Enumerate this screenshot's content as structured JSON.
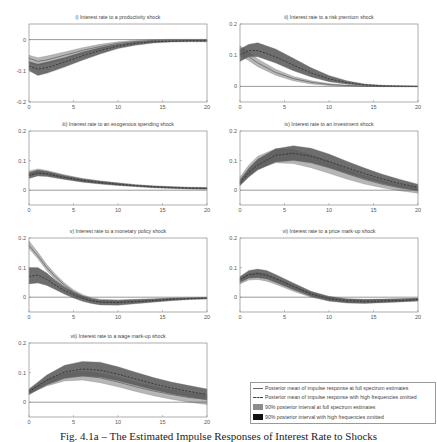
{
  "figure": {
    "caption": "Fig. 4.1a – The Estimated Impulse Responses of Interest Rate to Shocks"
  },
  "legend": {
    "items": [
      {
        "kind": "solid-line",
        "label": "Posterior mean of impulse response at full spectrum estimates"
      },
      {
        "kind": "dashed-line",
        "label": "Posterior mean of impulse response with high frequencies omitted"
      },
      {
        "kind": "light-band",
        "label": "90% posterior interval at full spectrum estimates",
        "color": "#8c8c8c"
      },
      {
        "kind": "dark-band",
        "label": "90% posterior interval with high frequencies omitted",
        "color": "#111111"
      }
    ]
  },
  "colors": {
    "full_band": "#a9a9a9",
    "omit_band": "#555555",
    "mean_line": "#666666",
    "dashed_line": "#2a2a2a",
    "axis": "#8a8a8a"
  },
  "chart_data": [
    {
      "type": "area",
      "title": "i) Interest rate to a productivity shock",
      "xlabel": "",
      "ylabel": "",
      "xlim": [
        0,
        20
      ],
      "ylim": [
        -0.2,
        0.05
      ],
      "xticks": [
        0,
        5,
        10,
        15,
        20
      ],
      "yticks": [
        -0.2,
        -0.1,
        0
      ],
      "ytick_labels": [
        "-0.2",
        "-0.1",
        "0"
      ],
      "x": [
        0,
        1,
        2,
        4,
        6,
        8,
        10,
        12,
        14,
        16,
        18,
        20
      ],
      "series": [
        {
          "name": "full spectrum mean",
          "values": [
            -0.06,
            -0.07,
            -0.065,
            -0.05,
            -0.035,
            -0.022,
            -0.012,
            -0.006,
            -0.003,
            -0.002,
            -0.002,
            -0.002
          ]
        },
        {
          "name": "full spectrum 90% lower",
          "values": [
            -0.075,
            -0.082,
            -0.077,
            -0.062,
            -0.045,
            -0.03,
            -0.018,
            -0.01,
            -0.006,
            -0.005,
            -0.005,
            -0.005
          ]
        },
        {
          "name": "full spectrum 90% upper",
          "values": [
            -0.05,
            -0.058,
            -0.053,
            -0.04,
            -0.026,
            -0.015,
            -0.007,
            -0.002,
            0.0,
            0.001,
            0.001,
            0.001
          ]
        },
        {
          "name": "high freq omitted mean",
          "values": [
            -0.085,
            -0.095,
            -0.09,
            -0.072,
            -0.052,
            -0.035,
            -0.021,
            -0.012,
            -0.007,
            -0.005,
            -0.004,
            -0.004
          ]
        },
        {
          "name": "high freq omitted 90% lower",
          "values": [
            -0.1,
            -0.115,
            -0.108,
            -0.088,
            -0.066,
            -0.046,
            -0.029,
            -0.018,
            -0.011,
            -0.008,
            -0.007,
            -0.007
          ]
        },
        {
          "name": "high freq omitted 90% upper",
          "values": [
            -0.07,
            -0.078,
            -0.072,
            -0.057,
            -0.04,
            -0.025,
            -0.014,
            -0.007,
            -0.003,
            -0.002,
            -0.001,
            -0.001
          ]
        }
      ]
    },
    {
      "type": "area",
      "title": "ii) Interest rate to a risk premium shock",
      "xlabel": "",
      "ylabel": "",
      "xlim": [
        0,
        20
      ],
      "ylim": [
        -0.05,
        0.2
      ],
      "xticks": [
        0,
        5,
        10,
        15,
        20
      ],
      "yticks": [
        0,
        0.1,
        0.2
      ],
      "ytick_labels": [
        "0",
        "0.1",
        "0.2"
      ],
      "x": [
        0,
        1,
        2,
        4,
        6,
        8,
        10,
        12,
        14,
        16,
        18,
        20
      ],
      "series": [
        {
          "name": "full spectrum mean",
          "values": [
            0.115,
            0.095,
            0.075,
            0.045,
            0.025,
            0.013,
            0.006,
            0.003,
            0.001,
            0.0,
            0.0,
            0.0
          ]
        },
        {
          "name": "full spectrum 90% lower",
          "values": [
            0.1,
            0.082,
            0.063,
            0.036,
            0.018,
            0.008,
            0.003,
            0.001,
            0.0,
            -0.001,
            -0.001,
            -0.001
          ]
        },
        {
          "name": "full spectrum 90% upper",
          "values": [
            0.13,
            0.11,
            0.088,
            0.055,
            0.032,
            0.018,
            0.009,
            0.004,
            0.002,
            0.001,
            0.001,
            0.0
          ]
        },
        {
          "name": "high freq omitted mean",
          "values": [
            0.1,
            0.115,
            0.115,
            0.095,
            0.068,
            0.043,
            0.024,
            0.012,
            0.005,
            0.002,
            0.001,
            0.0
          ]
        },
        {
          "name": "high freq omitted 90% lower",
          "values": [
            0.08,
            0.095,
            0.095,
            0.075,
            0.05,
            0.03,
            0.015,
            0.007,
            0.002,
            0.0,
            -0.001,
            -0.001
          ]
        },
        {
          "name": "high freq omitted 90% upper",
          "values": [
            0.12,
            0.135,
            0.14,
            0.12,
            0.09,
            0.06,
            0.035,
            0.018,
            0.008,
            0.004,
            0.002,
            0.001
          ]
        }
      ]
    },
    {
      "type": "area",
      "title": "iii) Interest rate to an exogenous spending shock",
      "xlabel": "",
      "ylabel": "",
      "xlim": [
        0,
        20
      ],
      "ylim": [
        -0.05,
        0.2
      ],
      "xticks": [
        0,
        5,
        10,
        15,
        20
      ],
      "yticks": [
        0,
        0.1,
        0.2
      ],
      "ytick_labels": [
        "0",
        "0.1",
        "0.2"
      ],
      "x": [
        0,
        1,
        2,
        4,
        6,
        8,
        10,
        12,
        14,
        16,
        18,
        20
      ],
      "series": [
        {
          "name": "full spectrum mean",
          "values": [
            0.055,
            0.062,
            0.058,
            0.045,
            0.035,
            0.027,
            0.021,
            0.016,
            0.012,
            0.01,
            0.008,
            0.007
          ]
        },
        {
          "name": "full spectrum 90% lower",
          "values": [
            0.048,
            0.055,
            0.051,
            0.039,
            0.029,
            0.022,
            0.017,
            0.012,
            0.009,
            0.007,
            0.005,
            0.004
          ]
        },
        {
          "name": "full spectrum 90% upper",
          "values": [
            0.065,
            0.072,
            0.067,
            0.052,
            0.04,
            0.031,
            0.025,
            0.019,
            0.015,
            0.012,
            0.01,
            0.009
          ]
        },
        {
          "name": "high freq omitted mean",
          "values": [
            0.05,
            0.058,
            0.055,
            0.043,
            0.033,
            0.026,
            0.02,
            0.015,
            0.011,
            0.009,
            0.007,
            0.006
          ]
        },
        {
          "name": "high freq omitted 90% lower",
          "values": [
            0.04,
            0.048,
            0.046,
            0.036,
            0.027,
            0.021,
            0.016,
            0.012,
            0.008,
            0.006,
            0.004,
            0.003
          ]
        },
        {
          "name": "high freq omitted 90% upper",
          "values": [
            0.06,
            0.068,
            0.064,
            0.05,
            0.039,
            0.031,
            0.024,
            0.018,
            0.014,
            0.011,
            0.009,
            0.008
          ]
        }
      ]
    },
    {
      "type": "area",
      "title": "iv) Interest rate to an investment shock",
      "xlabel": "",
      "ylabel": "",
      "xlim": [
        0,
        20
      ],
      "ylim": [
        -0.05,
        0.2
      ],
      "xticks": [
        0,
        5,
        10,
        15,
        20
      ],
      "yticks": [
        0,
        0.1,
        0.2
      ],
      "ytick_labels": [
        "0",
        "0.1",
        "0.2"
      ],
      "x": [
        0,
        1,
        2,
        4,
        6,
        8,
        10,
        12,
        14,
        16,
        18,
        20
      ],
      "series": [
        {
          "name": "full spectrum mean",
          "values": [
            0.03,
            0.065,
            0.09,
            0.115,
            0.112,
            0.098,
            0.078,
            0.056,
            0.036,
            0.02,
            0.008,
            0.0
          ]
        },
        {
          "name": "full spectrum 90% lower",
          "values": [
            0.02,
            0.05,
            0.072,
            0.093,
            0.09,
            0.076,
            0.057,
            0.038,
            0.021,
            0.008,
            -0.002,
            -0.01
          ]
        },
        {
          "name": "full spectrum 90% upper",
          "values": [
            0.045,
            0.085,
            0.115,
            0.14,
            0.137,
            0.12,
            0.097,
            0.072,
            0.05,
            0.032,
            0.018,
            0.008
          ]
        },
        {
          "name": "high freq omitted mean",
          "values": [
            0.025,
            0.06,
            0.085,
            0.118,
            0.125,
            0.115,
            0.097,
            0.076,
            0.056,
            0.038,
            0.022,
            0.01
          ]
        },
        {
          "name": "high freq omitted 90% lower",
          "values": [
            0.015,
            0.045,
            0.068,
            0.095,
            0.1,
            0.092,
            0.075,
            0.056,
            0.038,
            0.022,
            0.008,
            -0.003
          ]
        },
        {
          "name": "high freq omitted 90% upper",
          "values": [
            0.035,
            0.075,
            0.105,
            0.14,
            0.15,
            0.142,
            0.122,
            0.098,
            0.075,
            0.054,
            0.036,
            0.02
          ]
        }
      ]
    },
    {
      "type": "area",
      "title": "v) Interest rate to a monetary policy shock",
      "xlabel": "",
      "ylabel": "",
      "xlim": [
        0,
        20
      ],
      "ylim": [
        -0.05,
        0.2
      ],
      "xticks": [
        0,
        5,
        10,
        15,
        20
      ],
      "yticks": [
        0,
        0.1,
        0.2
      ],
      "ytick_labels": [
        "0",
        "0.1",
        "0.2"
      ],
      "x": [
        0,
        1,
        2,
        3,
        4,
        5,
        6,
        7,
        8,
        10,
        12,
        14,
        16,
        18,
        20
      ],
      "series": [
        {
          "name": "full spectrum mean",
          "values": [
            0.175,
            0.14,
            0.1,
            0.068,
            0.04,
            0.018,
            0.003,
            -0.007,
            -0.012,
            -0.014,
            -0.012,
            -0.009,
            -0.006,
            -0.004,
            -0.003
          ]
        },
        {
          "name": "full spectrum 90% lower",
          "values": [
            0.165,
            0.13,
            0.09,
            0.058,
            0.032,
            0.011,
            -0.003,
            -0.013,
            -0.018,
            -0.02,
            -0.017,
            -0.013,
            -0.009,
            -0.007,
            -0.005
          ]
        },
        {
          "name": "full spectrum 90% upper",
          "values": [
            0.19,
            0.152,
            0.11,
            0.077,
            0.048,
            0.025,
            0.009,
            -0.002,
            -0.007,
            -0.009,
            -0.007,
            -0.005,
            -0.003,
            -0.002,
            -0.001
          ]
        },
        {
          "name": "high freq omitted mean",
          "values": [
            0.07,
            0.075,
            0.06,
            0.04,
            0.022,
            0.008,
            -0.004,
            -0.012,
            -0.017,
            -0.018,
            -0.015,
            -0.011,
            -0.007,
            -0.005,
            -0.003
          ]
        },
        {
          "name": "high freq omitted 90% lower",
          "values": [
            0.045,
            0.048,
            0.04,
            0.025,
            0.01,
            -0.003,
            -0.014,
            -0.021,
            -0.026,
            -0.027,
            -0.022,
            -0.017,
            -0.012,
            -0.008,
            -0.006
          ]
        },
        {
          "name": "high freq omitted 90% upper",
          "values": [
            0.1,
            0.1,
            0.082,
            0.056,
            0.034,
            0.018,
            0.005,
            -0.004,
            -0.009,
            -0.01,
            -0.008,
            -0.006,
            -0.003,
            -0.002,
            -0.001
          ]
        }
      ]
    },
    {
      "type": "area",
      "title": "vi) Interest rate to a price mark-up shock",
      "xlabel": "",
      "ylabel": "",
      "xlim": [
        0,
        20
      ],
      "ylim": [
        -0.05,
        0.2
      ],
      "xticks": [
        0,
        5,
        10,
        15,
        20
      ],
      "yticks": [
        0,
        0.1,
        0.2
      ],
      "ytick_labels": [
        "0",
        "0.1",
        "0.2"
      ],
      "x": [
        0,
        1,
        2,
        3,
        4,
        6,
        8,
        10,
        12,
        14,
        16,
        18,
        20
      ],
      "series": [
        {
          "name": "full spectrum mean",
          "values": [
            0.055,
            0.07,
            0.072,
            0.066,
            0.055,
            0.03,
            0.008,
            -0.006,
            -0.012,
            -0.013,
            -0.012,
            -0.01,
            -0.008
          ]
        },
        {
          "name": "full spectrum 90% lower",
          "values": [
            0.045,
            0.058,
            0.06,
            0.054,
            0.044,
            0.02,
            0.0,
            -0.013,
            -0.018,
            -0.019,
            -0.017,
            -0.015,
            -0.013
          ]
        },
        {
          "name": "full spectrum 90% upper",
          "values": [
            0.065,
            0.08,
            0.083,
            0.077,
            0.065,
            0.04,
            0.015,
            0.0,
            -0.006,
            -0.008,
            -0.007,
            -0.005,
            -0.004
          ]
        },
        {
          "name": "high freq omitted mean",
          "values": [
            0.06,
            0.076,
            0.08,
            0.075,
            0.063,
            0.036,
            0.011,
            -0.005,
            -0.012,
            -0.014,
            -0.013,
            -0.011,
            -0.008
          ]
        },
        {
          "name": "high freq omitted 90% lower",
          "values": [
            0.05,
            0.064,
            0.066,
            0.061,
            0.05,
            0.025,
            0.002,
            -0.013,
            -0.02,
            -0.021,
            -0.019,
            -0.016,
            -0.013
          ]
        },
        {
          "name": "high freq omitted 90% upper",
          "values": [
            0.07,
            0.09,
            0.095,
            0.09,
            0.077,
            0.048,
            0.02,
            0.003,
            -0.005,
            -0.007,
            -0.006,
            -0.005,
            -0.003
          ]
        }
      ]
    },
    {
      "type": "area",
      "title": "vii) Interest rate to a wage mark-up shock",
      "xlabel": "",
      "ylabel": "",
      "xlim": [
        0,
        20
      ],
      "ylim": [
        -0.05,
        0.2
      ],
      "xticks": [
        0,
        5,
        10,
        15,
        20
      ],
      "yticks": [
        0,
        0.1,
        0.2
      ],
      "ytick_labels": [
        "0",
        "0.1",
        "0.2"
      ],
      "x": [
        0,
        1,
        2,
        4,
        6,
        8,
        10,
        12,
        14,
        16,
        18,
        20
      ],
      "series": [
        {
          "name": "full spectrum mean",
          "values": [
            0.035,
            0.05,
            0.065,
            0.085,
            0.09,
            0.082,
            0.068,
            0.052,
            0.038,
            0.026,
            0.016,
            0.009
          ]
        },
        {
          "name": "full spectrum 90% lower",
          "values": [
            0.028,
            0.042,
            0.055,
            0.072,
            0.075,
            0.066,
            0.052,
            0.036,
            0.022,
            0.01,
            0.0,
            -0.008
          ]
        },
        {
          "name": "full spectrum 90% upper",
          "values": [
            0.042,
            0.058,
            0.075,
            0.098,
            0.105,
            0.098,
            0.084,
            0.068,
            0.054,
            0.042,
            0.032,
            0.024
          ]
        },
        {
          "name": "high freq omitted mean",
          "values": [
            0.035,
            0.055,
            0.075,
            0.102,
            0.112,
            0.108,
            0.095,
            0.078,
            0.062,
            0.048,
            0.036,
            0.026
          ]
        },
        {
          "name": "high freq omitted 90% lower",
          "values": [
            0.025,
            0.042,
            0.058,
            0.08,
            0.088,
            0.084,
            0.072,
            0.056,
            0.041,
            0.028,
            0.017,
            0.008
          ]
        },
        {
          "name": "high freq omitted 90% upper",
          "values": [
            0.045,
            0.068,
            0.092,
            0.125,
            0.138,
            0.135,
            0.12,
            0.101,
            0.083,
            0.068,
            0.056,
            0.045
          ]
        }
      ]
    }
  ]
}
